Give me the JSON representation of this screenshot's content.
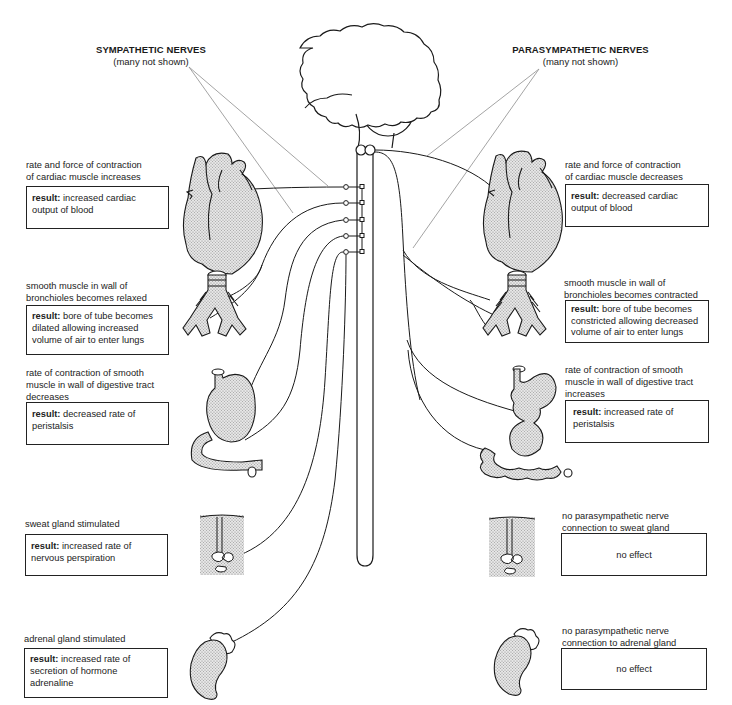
{
  "headers": {
    "sympathetic": {
      "title": "SYMPATHETIC NERVES",
      "subtitle": "(many not shown)"
    },
    "parasympathetic": {
      "title": "PARASYMPATHETIC NERVES",
      "subtitle": "(many not shown)"
    }
  },
  "sympathetic_effects": [
    {
      "organ": "heart",
      "description": [
        "rate and force of contraction",
        "of cardiac muscle increases"
      ],
      "result_label": "result:",
      "result": [
        "increased cardiac",
        "output of blood"
      ]
    },
    {
      "organ": "bronchioles",
      "description": [
        "smooth muscle in wall of",
        "bronchioles becomes relaxed"
      ],
      "result_label": "result:",
      "result": [
        "bore of tube becomes",
        "dilated allowing increased",
        "volume of air to enter lungs"
      ]
    },
    {
      "organ": "digestive-tract",
      "description": [
        "rate of contraction of smooth",
        "muscle in wall of digestive tract",
        "decreases"
      ],
      "result_label": "result:",
      "result": [
        "decreased rate of",
        "peristalsis"
      ]
    },
    {
      "organ": "sweat-gland",
      "description": [
        "sweat gland stimulated"
      ],
      "result_label": "result:",
      "result": [
        "increased rate of",
        "nervous perspiration"
      ]
    },
    {
      "organ": "adrenal-gland",
      "description": [
        "adrenal gland stimulated"
      ],
      "result_label": "result:",
      "result": [
        "increased rate of",
        "secretion of hormone",
        "adrenaline"
      ]
    }
  ],
  "parasympathetic_effects": [
    {
      "organ": "heart",
      "description": [
        "rate and force of contraction",
        "of cardiac muscle decreases"
      ],
      "result_label": "result:",
      "result": [
        "decreased cardiac",
        "output of blood"
      ]
    },
    {
      "organ": "bronchioles",
      "description": [
        "smooth muscle in wall of",
        "bronchioles becomes contracted"
      ],
      "result_label": "result:",
      "result": [
        "bore of tube becomes",
        "constricted allowing decreased",
        "volume of air to enter lungs"
      ]
    },
    {
      "organ": "digestive-tract",
      "description": [
        "rate of contraction of smooth",
        "muscle in wall of digestive tract",
        "increases"
      ],
      "result_label": "result:",
      "result": [
        "increased rate of",
        "peristalsis"
      ]
    },
    {
      "organ": "sweat-gland",
      "description": [
        "no parasympathetic nerve",
        "connection to sweat gland"
      ],
      "result_label": "",
      "result": [
        "no effect"
      ]
    },
    {
      "organ": "adrenal-gland",
      "description": [
        "no parasympathetic nerve",
        "connection to adrenal gland"
      ],
      "result_label": "",
      "result": [
        "no effect"
      ]
    }
  ],
  "colors": {
    "ink": "#1a1a1a",
    "pointer_line": "#9a9a9a",
    "organ_fill": "#d4d4d4"
  }
}
